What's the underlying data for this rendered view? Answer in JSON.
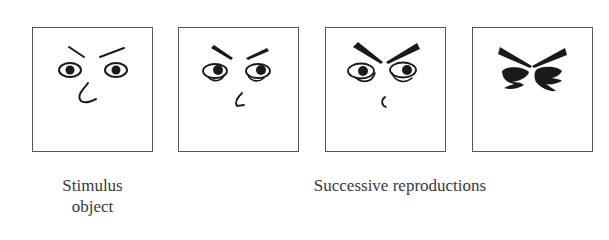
{
  "figure": {
    "panels": [
      {
        "id": "stimulus",
        "label": "Stimulus object face (original drawing)",
        "stage": 0
      },
      {
        "id": "reproduction-1",
        "label": "Reproduction 1 - thicker brows, curled lower eyelids",
        "stage": 1
      },
      {
        "id": "reproduction-2",
        "label": "Reproduction 2 - heavy wedge brows, small curved nose",
        "stage": 2
      },
      {
        "id": "reproduction-3",
        "label": "Reproduction 3 - abstract bird-like shape",
        "stage": 3
      }
    ],
    "captions": {
      "stimulus_line1": "Stimulus",
      "stimulus_line2": "object",
      "reproductions": "Successive reproductions"
    },
    "colors": {
      "ink": "#1a1a1a",
      "frame": "#555555",
      "text": "#3a3a3a",
      "background": "#ffffff"
    }
  }
}
